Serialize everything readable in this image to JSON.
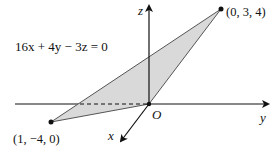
{
  "equation": "16x + 4y − 3z = 0",
  "axes": {
    "x_label": "x",
    "y_label": "y",
    "z_label": "z",
    "origin_label": "O"
  },
  "points": [
    {
      "label": "(0, 3, 4)",
      "coords": [
        0,
        3,
        4
      ]
    },
    {
      "label": "(1, −4, 0)",
      "coords": [
        1,
        -4,
        0
      ]
    }
  ],
  "colors": {
    "plane_fill": "#d9d9d9",
    "plane_edge": "#555555",
    "axis": "#111111"
  }
}
